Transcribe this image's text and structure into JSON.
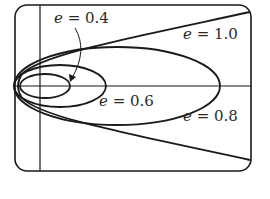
{
  "diagram": {
    "labels": {
      "e04": {
        "var": "e",
        "eq": " = ",
        "val": "0.4"
      },
      "e06": {
        "var": "e",
        "eq": " = ",
        "val": "0.6"
      },
      "e08": {
        "var": "e",
        "eq": " = ",
        "val": "0.8"
      },
      "e10": {
        "var": "e",
        "eq": " = ",
        "val": "1.0"
      }
    },
    "curves": [
      {
        "name": "ellipse",
        "eccentricity": "0.4"
      },
      {
        "name": "ellipse",
        "eccentricity": "0.6"
      },
      {
        "name": "ellipse",
        "eccentricity": "0.8"
      },
      {
        "name": "parabola",
        "eccentricity": "1.0"
      }
    ],
    "colors": {
      "stroke": "#1a1a1a",
      "background": "#ffffff"
    }
  }
}
